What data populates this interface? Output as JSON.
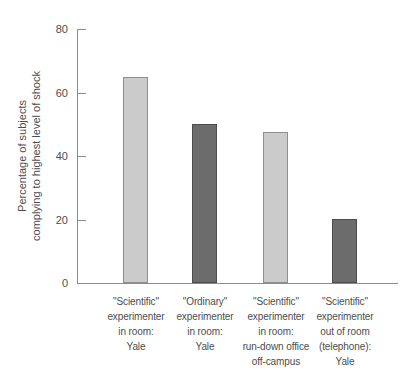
{
  "chart_data": {
    "type": "bar",
    "title": "",
    "xlabel": "",
    "ylabel": "Percentage of subjects complying to highest level of shock",
    "ylabel_lines": [
      "Percentage of subjects",
      "complying to highest level of shock"
    ],
    "ylim": [
      0,
      80
    ],
    "yticks": [
      80,
      60,
      40,
      20,
      0
    ],
    "grid": false,
    "legend": "none",
    "categories": [
      "\"Scientific\" experimenter in room: Yale",
      "\"Ordinary\" experimenter in room: Yale",
      "\"Scientific\" experimenter in room: run-down office off-campus",
      "\"Scientific\" experimenter out of room (telephone): Yale"
    ],
    "category_label_lines": [
      [
        "\"Scientific\"",
        "experimenter",
        "in room:",
        "Yale"
      ],
      [
        "\"Ordinary\"",
        "experimenter",
        "in room:",
        "Yale"
      ],
      [
        "\"Scientific\"",
        "experimenter",
        "in room:",
        "run-down office",
        "off-campus"
      ],
      [
        "\"Scientific\"",
        "experimenter",
        "out of room",
        "(telephone):",
        "Yale"
      ]
    ],
    "values": [
      65,
      50,
      47.5,
      20
    ],
    "bar_shades": [
      "light",
      "dark",
      "light",
      "dark"
    ],
    "colors": {
      "light_fill": "#cbcbcb",
      "light_border": "#8e8e8e",
      "dark_fill": "#6c6c6c",
      "dark_border": "#4c4c4c",
      "axis": "#8c8c8c",
      "text": "#4d4d4d"
    }
  }
}
